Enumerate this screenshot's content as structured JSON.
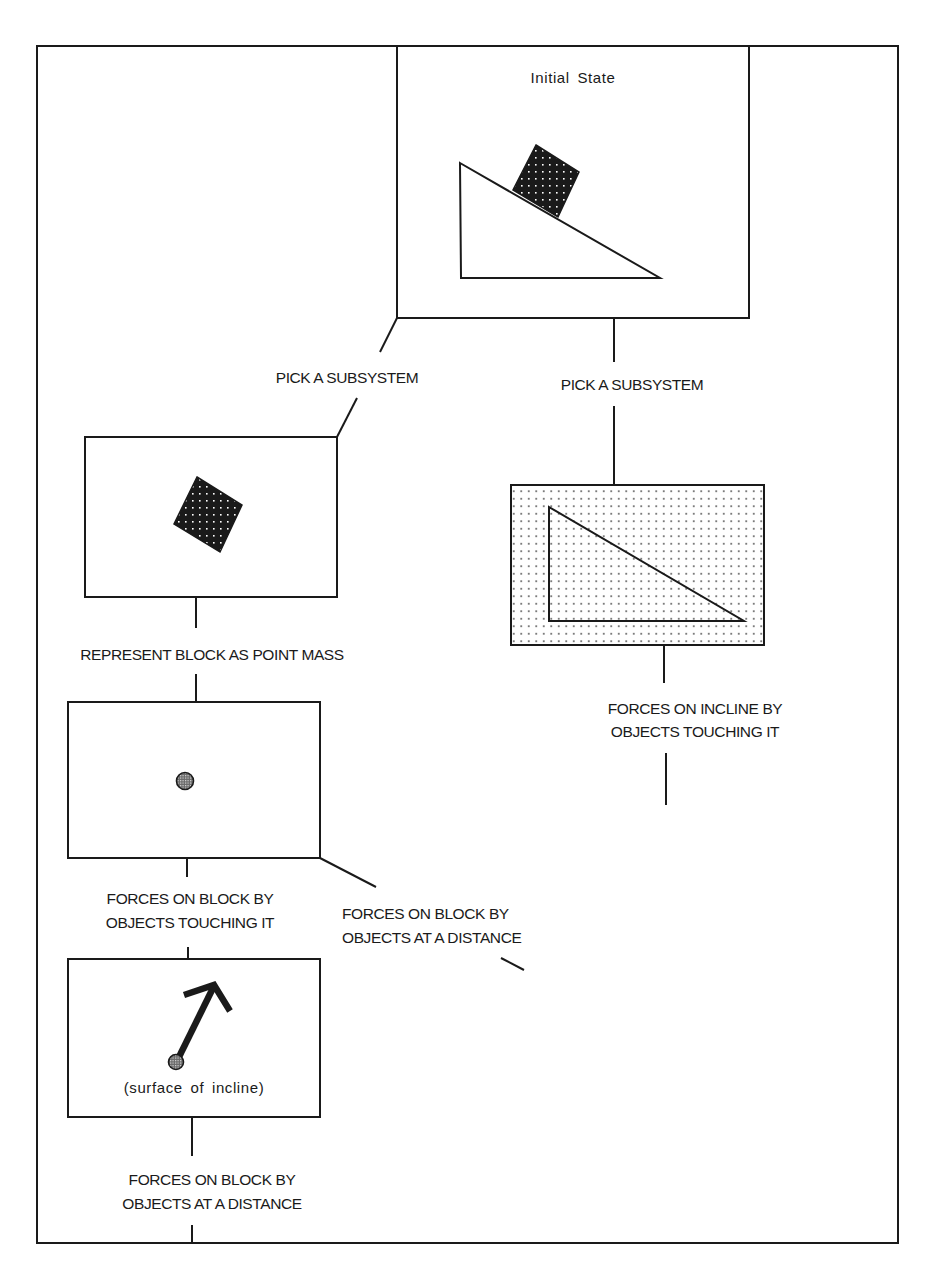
{
  "colors": {
    "ink": "#1a1a1a",
    "paper": "#ffffff",
    "block_fill": "#1a1a1a",
    "dot": "#ffffff",
    "point_mass": "#9a9a9a"
  },
  "nodes": {
    "initial_state": {
      "title": "Initial State"
    },
    "block_subsystem": {},
    "incline_subsystem": {},
    "point_mass": {},
    "contact_force": {
      "caption": "(surface of incline)"
    }
  },
  "edges": {
    "pick_left": {
      "label": "PICK A SUBSYSTEM"
    },
    "pick_right": {
      "label": "PICK A SUBSYSTEM"
    },
    "point_mass_step": {
      "label": "REPRESENT BLOCK AS POINT MASS"
    },
    "incline_contact": {
      "line1": "FORCES ON INCLINE BY",
      "line2": "OBJECTS TOUCHING IT"
    },
    "block_contact": {
      "line1": "FORCES ON BLOCK BY",
      "line2": "OBJECTS TOUCHING IT"
    },
    "block_distance_branch": {
      "line1": "FORCES ON BLOCK BY",
      "line2": "OBJECTS AT A DISTANCE"
    },
    "block_distance_bottom": {
      "line1": "FORCES ON BLOCK BY",
      "line2": "OBJECTS AT A DISTANCE"
    }
  }
}
